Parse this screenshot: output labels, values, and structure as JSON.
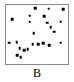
{
  "figure": {
    "label": "B",
    "background_color": "#ffffff",
    "frame_color": "#8a8a8a",
    "point_color": "#000000"
  },
  "chart_data": {
    "type": "scatter",
    "title": "B",
    "xlabel": "",
    "ylabel": "",
    "xlim": [
      0,
      100
    ],
    "ylim": [
      0,
      100
    ],
    "grid": false,
    "legend": false,
    "axis_ticks": false,
    "marker": "square",
    "marker_size": 2.6,
    "n_points": 24,
    "series": [
      {
        "name": "B",
        "color": "#000000",
        "points": [
          {
            "x": 47,
            "y": 95
          },
          {
            "x": 69,
            "y": 94
          },
          {
            "x": 92,
            "y": 93
          },
          {
            "x": 38,
            "y": 82
          },
          {
            "x": 62,
            "y": 81
          },
          {
            "x": 88,
            "y": 72
          },
          {
            "x": 10,
            "y": 76
          },
          {
            "x": 38,
            "y": 72
          },
          {
            "x": 66,
            "y": 70
          },
          {
            "x": 72,
            "y": 62
          },
          {
            "x": 78,
            "y": 55
          },
          {
            "x": 45,
            "y": 52
          },
          {
            "x": 5,
            "y": 36
          },
          {
            "x": 17,
            "y": 37
          },
          {
            "x": 43,
            "y": 34
          },
          {
            "x": 52,
            "y": 34
          },
          {
            "x": 60,
            "y": 35
          },
          {
            "x": 70,
            "y": 32
          },
          {
            "x": 88,
            "y": 36
          },
          {
            "x": 22,
            "y": 27
          },
          {
            "x": 29,
            "y": 23
          },
          {
            "x": 35,
            "y": 25
          },
          {
            "x": 18,
            "y": 15
          },
          {
            "x": 24,
            "y": 12
          }
        ]
      }
    ]
  }
}
